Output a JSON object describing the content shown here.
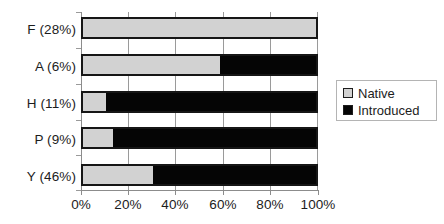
{
  "chart_data": {
    "type": "bar",
    "orientation": "horizontal",
    "stacked": true,
    "title": "",
    "subtitle": "",
    "xlabel": "",
    "ylabel": "",
    "xlim": [
      0,
      100
    ],
    "xtick_labels": [
      "0%",
      "20%",
      "40%",
      "60%",
      "80%",
      "100%"
    ],
    "xticks": [
      0,
      20,
      40,
      60,
      80,
      100
    ],
    "grid": true,
    "grid_axis": "x",
    "legend_position": "right",
    "categories": [
      "F (28%)",
      "A (6%)",
      "H (11%)",
      "P (9%)",
      "Y (46%)"
    ],
    "series": [
      {
        "name": "Native",
        "color": "#d2d2d2",
        "values": [
          100,
          59,
          10,
          13,
          30
        ]
      },
      {
        "name": "Introduced",
        "color": "#050505",
        "values": [
          0,
          41,
          90,
          87,
          70
        ]
      }
    ],
    "rows": [
      {
        "label": "F (28%)",
        "native": 100,
        "introduced": 0
      },
      {
        "label": "A (6%)",
        "native": 59,
        "introduced": 41
      },
      {
        "label": "H (11%)",
        "native": 10,
        "introduced": 90
      },
      {
        "label": "P (9%)",
        "native": 13,
        "introduced": 87
      },
      {
        "label": "Y (46%)",
        "native": 30,
        "introduced": 70
      }
    ]
  },
  "legend": {
    "items": [
      {
        "label": "Native",
        "swatch": "native-swatch-icon"
      },
      {
        "label": "Introduced",
        "swatch": "introduced-swatch-icon"
      }
    ]
  },
  "colors": {
    "native": "#d2d2d2",
    "introduced": "#050505",
    "axis": "#8c8c8c",
    "grid": "#9a9a9a",
    "text": "#1c1c1c",
    "background": "#ffffff"
  }
}
